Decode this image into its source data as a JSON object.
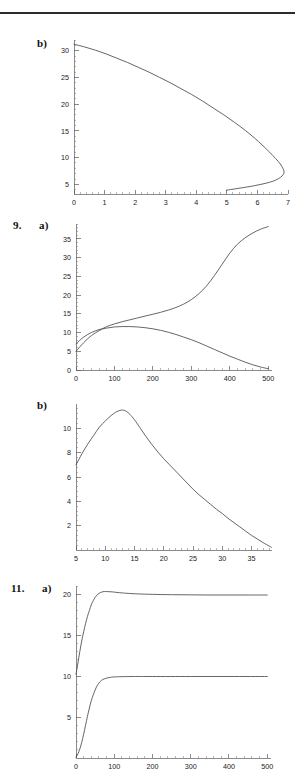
{
  "page": {
    "width": 295,
    "height": 784,
    "background": "#ffffff",
    "ink": "#4a4a4a",
    "rule_color": "#2b2b2b"
  },
  "figures": [
    {
      "number": "",
      "part": "b)",
      "index": 0
    },
    {
      "number": "9.",
      "part": "a)",
      "index": 1
    },
    {
      "number": "",
      "part": "b)",
      "index": 2
    },
    {
      "number": "11.",
      "part": "a)",
      "index": 3
    }
  ],
  "chart_data": [
    {
      "type": "line",
      "title": "b)",
      "xlabel": "",
      "ylabel": "",
      "xlim": [
        0,
        7
      ],
      "ylim": [
        3.2,
        32
      ],
      "grid": false,
      "legend": null,
      "xticks": [
        0,
        1,
        2,
        3,
        4,
        5,
        6,
        7
      ],
      "xtick_labels": [
        "0",
        "1",
        "2",
        "3",
        "4",
        "5",
        "6",
        "7"
      ],
      "yticks": [
        5,
        10,
        15,
        20,
        25,
        30
      ],
      "ytick_labels": [
        "5",
        "10",
        "15",
        "20",
        "25",
        "30"
      ],
      "minor_ticks": true,
      "series": [
        {
          "name": "phase-curve",
          "comment": "single open C-shaped trajectory, upper branch descends from (0,31.2) to turning point near (6.85,7.6), lower branch returns left to (5.0,3.9)",
          "points": [
            [
              0.0,
              31.2
            ],
            [
              0.35,
              30.7
            ],
            [
              0.7,
              30.1
            ],
            [
              1.05,
              29.4
            ],
            [
              1.4,
              28.6
            ],
            [
              1.75,
              27.8
            ],
            [
              2.1,
              26.9
            ],
            [
              2.45,
              26.0
            ],
            [
              2.8,
              25.0
            ],
            [
              3.15,
              24.0
            ],
            [
              3.5,
              22.9
            ],
            [
              3.85,
              21.8
            ],
            [
              4.2,
              20.6
            ],
            [
              4.55,
              19.3
            ],
            [
              4.9,
              18.0
            ],
            [
              5.25,
              16.6
            ],
            [
              5.6,
              15.1
            ],
            [
              5.9,
              13.7
            ],
            [
              6.15,
              12.4
            ],
            [
              6.4,
              11.0
            ],
            [
              6.6,
              9.8
            ],
            [
              6.75,
              8.8
            ],
            [
              6.84,
              7.9
            ],
            [
              6.87,
              7.3
            ],
            [
              6.84,
              6.8
            ],
            [
              6.75,
              6.3
            ],
            [
              6.6,
              5.8
            ],
            [
              6.4,
              5.4
            ],
            [
              6.15,
              5.05
            ],
            [
              5.9,
              4.75
            ],
            [
              5.65,
              4.5
            ],
            [
              5.4,
              4.28
            ],
            [
              5.2,
              4.1
            ],
            [
              5.05,
              3.97
            ],
            [
              4.98,
              3.9
            ]
          ]
        }
      ]
    },
    {
      "type": "line",
      "title": "9. a)",
      "xlabel": "",
      "ylabel": "",
      "xlim": [
        0,
        510
      ],
      "ylim": [
        0,
        39
      ],
      "grid": false,
      "legend": null,
      "xticks": [
        0,
        100,
        200,
        300,
        400,
        500
      ],
      "xtick_labels": [
        "0",
        "100",
        "200",
        "300",
        "400",
        "500"
      ],
      "yticks": [
        0,
        5,
        10,
        15,
        20,
        25,
        30,
        35
      ],
      "ytick_labels": [
        "0",
        "5",
        "10",
        "15",
        "20",
        "25",
        "30",
        "35"
      ],
      "minor_ticks": true,
      "series": [
        {
          "name": "rising-sigmoid",
          "comment": "starts at (0,5), crosses other curve near (70,11), slow middle plateau, steep rise 300-400, ends (500,38.3)",
          "points": [
            [
              0,
              5.0
            ],
            [
              20,
              7.3
            ],
            [
              40,
              9.2
            ],
            [
              60,
              10.5
            ],
            [
              80,
              11.6
            ],
            [
              100,
              12.3
            ],
            [
              120,
              12.9
            ],
            [
              140,
              13.4
            ],
            [
              160,
              13.9
            ],
            [
              180,
              14.4
            ],
            [
              200,
              14.9
            ],
            [
              220,
              15.4
            ],
            [
              240,
              16.0
            ],
            [
              260,
              16.7
            ],
            [
              280,
              17.6
            ],
            [
              300,
              18.8
            ],
            [
              320,
              20.4
            ],
            [
              340,
              22.5
            ],
            [
              360,
              25.2
            ],
            [
              380,
              28.2
            ],
            [
              400,
              31.2
            ],
            [
              420,
              33.6
            ],
            [
              440,
              35.3
            ],
            [
              460,
              36.6
            ],
            [
              480,
              37.6
            ],
            [
              500,
              38.3
            ]
          ]
        },
        {
          "name": "peaking-decay",
          "comment": "starts at (0,7), rises to broad max 11.6 near x=130, then decays to ~0.3 at x=500",
          "points": [
            [
              0,
              7.0
            ],
            [
              20,
              8.8
            ],
            [
              40,
              10.0
            ],
            [
              60,
              10.8
            ],
            [
              80,
              11.2
            ],
            [
              100,
              11.5
            ],
            [
              120,
              11.6
            ],
            [
              140,
              11.6
            ],
            [
              160,
              11.5
            ],
            [
              180,
              11.3
            ],
            [
              200,
              11.0
            ],
            [
              220,
              10.6
            ],
            [
              240,
              10.1
            ],
            [
              260,
              9.5
            ],
            [
              280,
              8.8
            ],
            [
              300,
              8.1
            ],
            [
              320,
              7.3
            ],
            [
              340,
              6.4
            ],
            [
              360,
              5.5
            ],
            [
              380,
              4.6
            ],
            [
              400,
              3.7
            ],
            [
              420,
              2.9
            ],
            [
              440,
              2.1
            ],
            [
              460,
              1.4
            ],
            [
              480,
              0.8
            ],
            [
              500,
              0.35
            ]
          ]
        }
      ]
    },
    {
      "type": "line",
      "title": "b)",
      "xlabel": "",
      "ylabel": "",
      "xlim": [
        5,
        38.5
      ],
      "ylim": [
        0,
        12
      ],
      "grid": false,
      "legend": null,
      "xticks": [
        5,
        10,
        15,
        20,
        25,
        30,
        35
      ],
      "xtick_labels": [
        "5",
        "10",
        "15",
        "20",
        "25",
        "30",
        "35"
      ],
      "yticks": [
        2,
        4,
        6,
        8,
        10
      ],
      "ytick_labels": [
        "2",
        "4",
        "6",
        "8",
        "10"
      ],
      "minor_ticks": true,
      "series": [
        {
          "name": "skewed-peak",
          "comment": "rises from (5,7.0) to sharp peak (12.9,11.5), then long right tail down to (38.3,0.3)",
          "points": [
            [
              5.0,
              7.0
            ],
            [
              6.0,
              7.9
            ],
            [
              7.0,
              8.7
            ],
            [
              8.0,
              9.4
            ],
            [
              9.0,
              10.1
            ],
            [
              10.0,
              10.6
            ],
            [
              11.0,
              11.05
            ],
            [
              11.8,
              11.33
            ],
            [
              12.5,
              11.47
            ],
            [
              13.0,
              11.5
            ],
            [
              13.6,
              11.4
            ],
            [
              14.2,
              11.15
            ],
            [
              15.0,
              10.7
            ],
            [
              16.0,
              10.0
            ],
            [
              17.0,
              9.3
            ],
            [
              18.0,
              8.65
            ],
            [
              19.0,
              8.05
            ],
            [
              20.0,
              7.5
            ],
            [
              21.0,
              7.0
            ],
            [
              22.0,
              6.5
            ],
            [
              23.0,
              6.0
            ],
            [
              24.0,
              5.5
            ],
            [
              25.0,
              5.0
            ],
            [
              26.0,
              4.55
            ],
            [
              27.0,
              4.15
            ],
            [
              28.0,
              3.75
            ],
            [
              29.0,
              3.35
            ],
            [
              30.0,
              3.0
            ],
            [
              31.0,
              2.6
            ],
            [
              32.0,
              2.25
            ],
            [
              33.0,
              1.9
            ],
            [
              34.0,
              1.55
            ],
            [
              35.0,
              1.2
            ],
            [
              36.0,
              0.9
            ],
            [
              37.0,
              0.6
            ],
            [
              38.0,
              0.33
            ],
            [
              38.4,
              0.22
            ]
          ]
        }
      ]
    },
    {
      "type": "line",
      "title": "11. a)",
      "xlabel": "",
      "ylabel": "",
      "xlim": [
        0,
        510
      ],
      "ylim": [
        0,
        21
      ],
      "grid": false,
      "legend": null,
      "xticks": [
        0,
        100,
        200,
        300,
        400,
        500
      ],
      "xtick_labels": [
        "0",
        "100",
        "200",
        "300",
        "400",
        "500"
      ],
      "yticks": [
        5,
        10,
        15,
        20
      ],
      "ytick_labels": [
        "5",
        "10",
        "15",
        "20"
      ],
      "minor_ticks": true,
      "series": [
        {
          "name": "upper-overshoot",
          "comment": "starts at (0,10.2), rises steeply, slight overshoot to 20.3 near x=70, settles to 19.9",
          "points": [
            [
              0,
              10.2
            ],
            [
              5,
              11.6
            ],
            [
              10,
              13.0
            ],
            [
              15,
              14.3
            ],
            [
              20,
              15.4
            ],
            [
              25,
              16.4
            ],
            [
              30,
              17.3
            ],
            [
              35,
              18.0
            ],
            [
              40,
              18.7
            ],
            [
              45,
              19.2
            ],
            [
              50,
              19.6
            ],
            [
              55,
              19.9
            ],
            [
              60,
              20.1
            ],
            [
              70,
              20.3
            ],
            [
              80,
              20.32
            ],
            [
              95,
              20.28
            ],
            [
              110,
              20.2
            ],
            [
              130,
              20.12
            ],
            [
              160,
              20.04
            ],
            [
              200,
              19.98
            ],
            [
              250,
              19.94
            ],
            [
              300,
              19.92
            ],
            [
              350,
              19.9
            ],
            [
              400,
              19.9
            ],
            [
              450,
              19.9
            ],
            [
              500,
              19.9
            ]
          ]
        },
        {
          "name": "lower-saturating",
          "comment": "starts at (0,0.1), sigmoidal rise, saturates at 9.95",
          "points": [
            [
              0,
              0.1
            ],
            [
              5,
              0.5
            ],
            [
              10,
              1.1
            ],
            [
              15,
              1.9
            ],
            [
              20,
              2.9
            ],
            [
              25,
              4.0
            ],
            [
              30,
              5.1
            ],
            [
              35,
              6.1
            ],
            [
              40,
              7.0
            ],
            [
              45,
              7.7
            ],
            [
              50,
              8.3
            ],
            [
              55,
              8.8
            ],
            [
              60,
              9.15
            ],
            [
              65,
              9.4
            ],
            [
              70,
              9.58
            ],
            [
              80,
              9.75
            ],
            [
              90,
              9.85
            ],
            [
              100,
              9.9
            ],
            [
              120,
              9.93
            ],
            [
              150,
              9.95
            ],
            [
              200,
              9.95
            ],
            [
              300,
              9.95
            ],
            [
              400,
              9.95
            ],
            [
              500,
              9.95
            ]
          ]
        }
      ]
    }
  ]
}
